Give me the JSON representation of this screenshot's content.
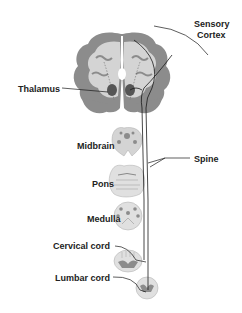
{
  "diagram": {
    "type": "anatomical-pathway",
    "labels": {
      "sensory_cortex_line1": "Sensory",
      "sensory_cortex_line2": "Cortex",
      "thalamus": "Thalamus",
      "midbrain": "Midbrain",
      "spine": "Spine",
      "pons": "Pons",
      "medulla": "Medulla",
      "cervical_cord": "Cervical cord",
      "lumbar_cord": "Lumbar cord"
    },
    "colors": {
      "tissue_light": "#d4d4d4",
      "tissue_dark": "#8c8c8c",
      "pathway_line": "#1a1a1a",
      "label_text": "#222222",
      "background": "#ffffff"
    }
  }
}
